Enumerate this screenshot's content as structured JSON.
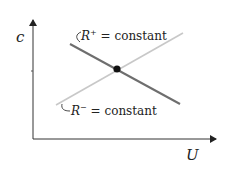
{
  "diagram": {
    "axes": {
      "y_label": "c",
      "x_label": "U"
    },
    "lines": [
      {
        "name": "R+",
        "label_main": "R",
        "label_sup": "+",
        "label_rest": " = constant",
        "color": "#6e6e6e"
      },
      {
        "name": "R-",
        "label_main": "R",
        "label_sup": "−",
        "label_rest": " = constant",
        "color": "#c8c8c8"
      }
    ],
    "intersection_point": {
      "color": "#111111"
    }
  }
}
